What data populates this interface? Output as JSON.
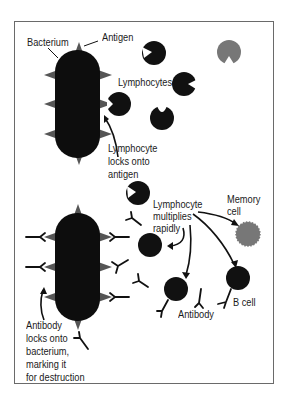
{
  "diagram": {
    "title_fragment": "",
    "colors": {
      "cell_dark": "#111111",
      "antigen": "#555555",
      "memory_cell": "#777777",
      "frame": "#6a6a6a",
      "text": "#1a1a1a"
    },
    "top_panel": {
      "labels": {
        "bacterium": "Bacterium",
        "antigen": "Antigen",
        "lymphocytes": "Lymphocytes",
        "lock_line1": "Lymphocyte",
        "lock_line2": "locks onto",
        "lock_line3": "antigen"
      }
    },
    "bottom_panel": {
      "labels": {
        "multiply_line1": "Lymphocyte",
        "multiply_line2": "multiplies",
        "multiply_line3": "rapidly",
        "memory_line1": "Memory",
        "memory_line2": "cell",
        "b_cell": "B cell",
        "antibody": "Antibody",
        "ab_lock_line1": "Antibody",
        "ab_lock_line2": "locks onto",
        "ab_lock_line3": "bacterium,",
        "ab_lock_line4": "marking it",
        "ab_lock_line5": "for destruction"
      }
    }
  }
}
